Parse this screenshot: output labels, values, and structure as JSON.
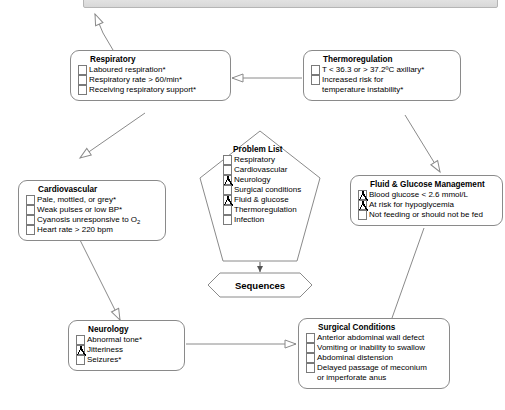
{
  "diagram": {
    "top_bar_label": "",
    "line_color": "#8a8a8a",
    "text_color": "#000000",
    "background": "#ffffff"
  },
  "nodes": {
    "respiratory": {
      "title": "Respiratory",
      "items": [
        {
          "label": "Laboured respiration*",
          "checked": false
        },
        {
          "label": "Respiratory rate > 60/min*",
          "checked": false
        },
        {
          "label": "Receiving respiratory support*",
          "checked": false
        }
      ]
    },
    "thermoregulation": {
      "title": "Thermoregulation",
      "items": [
        {
          "label": "T < 36.3 or > 37.2ºC axillary*",
          "checked": false
        },
        {
          "label": "Increased risk for",
          "checked": false
        },
        {
          "label": "temperature instability*",
          "checked": false,
          "continuation": true
        }
      ]
    },
    "cardiovascular": {
      "title": "Cardiovascular",
      "items": [
        {
          "label": "Pale, mottled, or grey*",
          "checked": false
        },
        {
          "label": "Weak pulses or low BP*",
          "checked": false
        },
        {
          "label": "Cyanosis unresponsive to O",
          "sub": "2",
          "checked": false
        },
        {
          "label": "Heart rate > 220 bpm",
          "checked": false
        }
      ]
    },
    "problem_list": {
      "title": "Problem List",
      "items": [
        {
          "label": "Respiratory",
          "checked": false
        },
        {
          "label": "Cardiovascular",
          "checked": false
        },
        {
          "label": "Neurology",
          "checked": true
        },
        {
          "label": "Surgical conditions",
          "checked": false
        },
        {
          "label": "Fluid & glucose",
          "checked": true
        },
        {
          "label": "Thermoregulation",
          "checked": false
        },
        {
          "label": "Infection",
          "checked": false
        }
      ]
    },
    "fluid_glucose": {
      "title": "Fluid & Glucose Management",
      "items": [
        {
          "label": "Blood glucose < 2.6 mmol/L",
          "checked": true
        },
        {
          "label": "At risk for hypoglycemia",
          "checked": true
        },
        {
          "label": "Not feeding or should not be fed",
          "checked": false
        }
      ]
    },
    "neurology": {
      "title": "Neurology",
      "items": [
        {
          "label": "Abnormal tone*",
          "checked": false
        },
        {
          "label": "Jitteriness",
          "checked": true
        },
        {
          "label": "Seizures*",
          "checked": false
        }
      ]
    },
    "surgical_conditions": {
      "title": "Surgical Conditions",
      "items": [
        {
          "label": "Anterior abdominal wall defect",
          "checked": false
        },
        {
          "label": "Vomiting or inability to swallow",
          "checked": false
        },
        {
          "label": "Abdominal distension",
          "checked": false
        },
        {
          "label": "Delayed passage of meconium",
          "checked": false
        },
        {
          "label": "or imperforate anus",
          "checked": false,
          "continuation": true
        }
      ]
    },
    "sequences": {
      "label": "Sequences"
    }
  }
}
